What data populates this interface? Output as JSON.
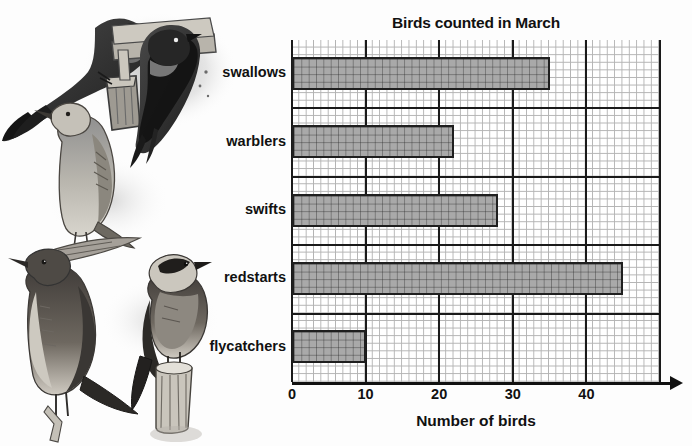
{
  "chart_data": {
    "type": "bar",
    "orientation": "horizontal",
    "title": "Birds counted in March",
    "xlabel": "Number of birds",
    "ylabel": "",
    "categories": [
      "swallows",
      "warblers",
      "swifts",
      "redstarts",
      "flycatchers"
    ],
    "values": [
      35,
      22,
      28,
      45,
      10
    ],
    "xlim": [
      0,
      50
    ],
    "xticks": [
      0,
      10,
      20,
      30,
      40
    ],
    "xtick_labels": [
      "0",
      "10",
      "20",
      "30",
      "40"
    ],
    "minor_gridline_step": 1,
    "major_gridline_step": 10,
    "grid": true,
    "legend": "none",
    "bar_fill_color": "#a9a9a9",
    "bar_edge_color": "#1f1f1f",
    "grid_color": "#9a9a9a",
    "major_grid_color": "#1a1a1a",
    "text_color": "#111111"
  },
  "illustrations": {
    "caption": "",
    "birds": [
      {
        "name": "swallow-perched-illustration",
        "alt": "swallow perched on post"
      },
      {
        "name": "swallow-at-nest-illustration",
        "alt": "swallow at nest under eave"
      },
      {
        "name": "warbler-illustration",
        "alt": "warbler perched on branch"
      },
      {
        "name": "flycatcher-illustration",
        "alt": "flycatcher perched on twig"
      },
      {
        "name": "redstart-illustration",
        "alt": "redstart perched on post"
      }
    ]
  }
}
